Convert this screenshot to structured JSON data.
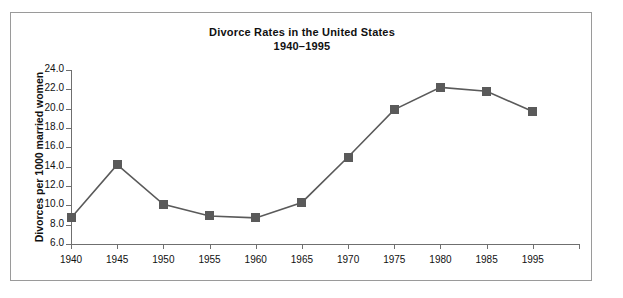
{
  "chart_data": {
    "type": "line",
    "title": "Divorce Rates in the United States",
    "subtitle": "1940–1995",
    "xlabel": "",
    "ylabel": "Divorces per 1000 married women",
    "categories": [
      "1940",
      "1945",
      "1950",
      "1955",
      "1960",
      "1965",
      "1970",
      "1975",
      "1980",
      "1985",
      "1995"
    ],
    "values": [
      8.7,
      14.2,
      10.1,
      8.9,
      8.7,
      10.3,
      15.0,
      19.9,
      22.2,
      21.8,
      19.7
    ],
    "series": [
      {
        "name": "Divorce rate",
        "values": [
          8.7,
          14.2,
          10.1,
          8.9,
          8.7,
          10.3,
          15.0,
          19.9,
          22.2,
          21.8,
          19.7
        ]
      }
    ],
    "ylim": [
      6.0,
      24.0
    ],
    "ytick_step": 2.0,
    "ytick_labels": [
      "24.0",
      "22.0",
      "20.0",
      "18.0",
      "16.0",
      "14.0",
      "12.0",
      "10.0",
      "8.0",
      "6.0"
    ],
    "grid": false,
    "legend": "none",
    "marker": "square",
    "line_color": "#5a5a5a",
    "marker_color": "#5a5a5a",
    "axis_color": "#6f6f6f",
    "frame_color": "#9a9a9a",
    "background": "#ffffff"
  }
}
